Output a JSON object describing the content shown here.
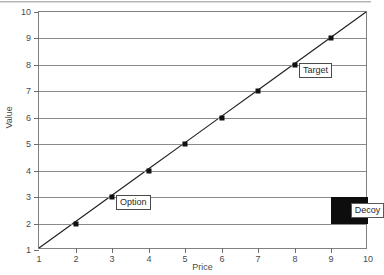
{
  "chart_data": {
    "type": "line",
    "title": "",
    "xlabel": "Price",
    "ylabel": "Value",
    "xlim": [
      1,
      10
    ],
    "ylim": [
      1,
      10
    ],
    "xticks": [
      1,
      2,
      3,
      4,
      5,
      6,
      7,
      8,
      9,
      10
    ],
    "yticks": [
      1,
      2,
      3,
      4,
      5,
      6,
      7,
      8,
      9,
      10
    ],
    "grid": "horizontal",
    "legend": "none",
    "series": [
      {
        "name": "value-line",
        "x": [
          1,
          2,
          3,
          4,
          5,
          6,
          7,
          8,
          9,
          10
        ],
        "values": [
          1,
          2,
          3,
          4,
          5,
          6,
          7,
          8,
          9,
          10
        ],
        "marker": "filled-square",
        "marker_x": [
          2,
          3,
          4,
          5,
          6,
          7,
          8,
          9
        ],
        "marker_y": [
          2,
          3,
          4,
          5,
          6,
          7,
          8,
          9
        ],
        "line_color": "#222222",
        "marker_color": "#111111"
      }
    ],
    "annotations": [
      {
        "id": "option",
        "label": "Option",
        "x": 3,
        "y": 3,
        "kind": "boxed-callout"
      },
      {
        "id": "target",
        "label": "Target",
        "x": 8,
        "y": 8,
        "kind": "boxed-callout"
      },
      {
        "id": "decoy",
        "label": "Decoy",
        "x": 9.5,
        "y": 2.5,
        "kind": "black-patch-label"
      }
    ],
    "patches": [
      {
        "id": "decoy-patch",
        "x0": 9.0,
        "x1": 10.0,
        "y0": 2.0,
        "y1": 3.0,
        "color": "#0d0d0d"
      }
    ]
  },
  "axes": {
    "x_tick_labels": [
      "1",
      "2",
      "3",
      "4",
      "5",
      "6",
      "7",
      "8",
      "9",
      "10"
    ],
    "y_tick_labels": [
      "1",
      "2",
      "3",
      "4",
      "5",
      "6",
      "7",
      "8",
      "9",
      "10"
    ],
    "x_title": "Price",
    "y_title": "Value"
  },
  "labels": {
    "option": "Option",
    "target": "Target",
    "decoy": "Decoy"
  },
  "colors": {
    "frame": "#808080",
    "grid": "#8a8a8a",
    "line": "#222222",
    "marker": "#111111",
    "decoy_patch": "#0d0d0d",
    "text": "#4a4a4a",
    "background": "#ffffff"
  }
}
